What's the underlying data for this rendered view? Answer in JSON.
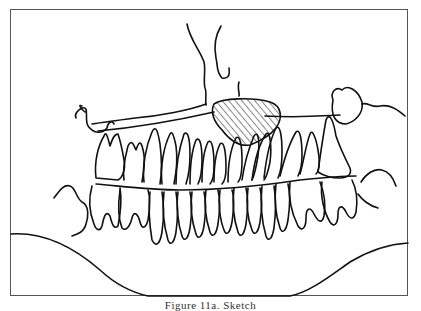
{
  "figure": {
    "caption": "Figure 11a. Sketch",
    "hatched_region_label": "lesion",
    "stroke_color": "#111111",
    "frame_color": "#555555",
    "background": "#ffffff"
  }
}
